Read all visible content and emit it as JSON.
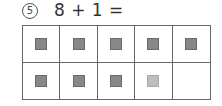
{
  "problem": {
    "number_label": "5",
    "equation": "8 + 1 ="
  },
  "ten_frame": {
    "rows": [
      [
        "dark",
        "dark",
        "dark",
        "dark",
        "dark"
      ],
      [
        "dark",
        "dark",
        "dark",
        "light",
        "empty"
      ]
    ]
  },
  "colors": {
    "dark_square": "#888888",
    "light_square": "#bdbdbd",
    "grid_line": "#666666"
  }
}
